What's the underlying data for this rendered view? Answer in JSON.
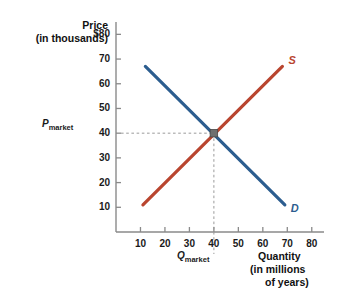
{
  "chart_data": {
    "type": "line",
    "title": "",
    "ylabel": "Price",
    "ylabel_sub": "(in thousands)",
    "ytick_top": "$80",
    "xlabel": "Quantity",
    "xlabel_sub1": "(in millions",
    "xlabel_sub2": "of years)",
    "xticks": [
      10,
      20,
      30,
      40,
      50,
      60,
      70,
      80
    ],
    "xtick_labels": [
      "10",
      "20",
      "30",
      "40",
      "50",
      "60",
      "70",
      "80"
    ],
    "yticks": [
      10,
      20,
      30,
      40,
      50,
      60,
      70,
      80
    ],
    "ytick_labels": [
      "10",
      "20",
      "30",
      "40",
      "50",
      "60",
      "70",
      "$80"
    ],
    "xlim": [
      0,
      85
    ],
    "ylim": [
      0,
      85
    ],
    "grid": false,
    "legend": "inline-curve-labels",
    "series": [
      {
        "name": "S",
        "label": "S",
        "color": "#b9452f",
        "role": "supply",
        "x": [
          11,
          68
        ],
        "y": [
          11,
          67
        ]
      },
      {
        "name": "D",
        "label": "D",
        "color": "#2c5d8f",
        "role": "demand",
        "x": [
          12,
          69
        ],
        "y": [
          67,
          11
        ]
      }
    ],
    "equilibrium": {
      "x": 40,
      "y": 40,
      "marker_color": "#6f6f6f",
      "price_label": "P",
      "price_sub": "market",
      "quantity_label": "Q",
      "quantity_sub": "market",
      "guide_color": "#9a9a9a"
    }
  },
  "axes": {
    "line_color": "#888888",
    "tick_color": "#888888"
  }
}
